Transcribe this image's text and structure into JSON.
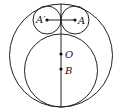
{
  "diagram": {
    "type": "geometry",
    "stroke_color": "#222222",
    "background": "#ffffff",
    "shapes": {
      "outer_circle": {
        "cx": 61,
        "cy": 55.5,
        "r": 51.5
      },
      "inner_circle": {
        "cx": 61,
        "cy": 70.5,
        "r": 36.5
      },
      "small_circle_left": {
        "cx": 47,
        "cy": 20,
        "r": 14
      },
      "small_circle_right": {
        "cx": 75,
        "cy": 20,
        "r": 14
      },
      "vertical_axis": {
        "x": 61,
        "y1": 4,
        "y2": 107
      },
      "segment_AA": {
        "x1": 47,
        "y1": 20,
        "x2": 75,
        "y2": 20
      }
    },
    "points": [
      {
        "name": "A'",
        "label": "A′",
        "x": 47,
        "y": 20
      },
      {
        "name": "A",
        "label": "A",
        "x": 75,
        "y": 20
      },
      {
        "name": "O",
        "label": "O",
        "x": 61,
        "y": 54
      },
      {
        "name": "B",
        "label": "B",
        "x": 61,
        "y": 69
      }
    ],
    "labels": {
      "A_prime": "A′",
      "A": "A",
      "O": "O",
      "B": "B"
    }
  }
}
